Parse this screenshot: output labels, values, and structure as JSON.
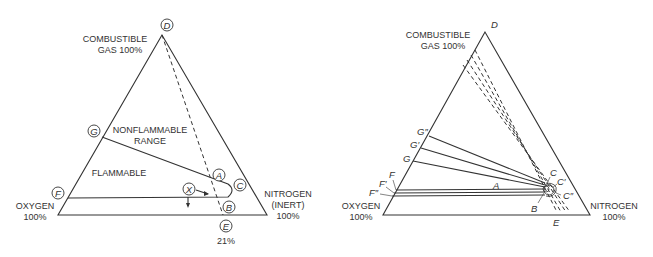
{
  "left_diagram": {
    "vertices": {
      "top": "COMBUSTIBLE",
      "top2": "GAS 100%",
      "left": "OXYGEN",
      "left2": "100%",
      "right": "NITROGEN",
      "right2": "(INERT)",
      "right3": "100%"
    },
    "regions": {
      "nonflammable1": "NONFLAMMABLE",
      "nonflammable2": "RANGE",
      "flammable": "FLAMMABLE"
    },
    "points": {
      "D": "D",
      "G": "G",
      "F": "F",
      "A": "A",
      "C": "C",
      "X": "X",
      "B": "B",
      "E": "E"
    },
    "e_value": "21%"
  },
  "right_diagram": {
    "vertices": {
      "top": "COMBUSTIBLE",
      "top2": "GAS 100%",
      "left": "OXYGEN",
      "left2": "100%",
      "right": "NITROGEN",
      "right2": "100%"
    },
    "points": {
      "D": "D",
      "G2": "G″",
      "G1": "G′",
      "G": "G",
      "F": "F",
      "F1": "F′",
      "F2": "F″",
      "A": "A",
      "B": "B",
      "C": "C",
      "C1": "C′",
      "C2": "C″",
      "E": "E"
    }
  }
}
